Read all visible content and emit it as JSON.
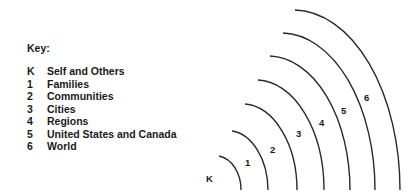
{
  "key": {
    "title": "Key:",
    "items": [
      {
        "code": "K",
        "label": "Self and Others"
      },
      {
        "code": "1",
        "label": "Families"
      },
      {
        "code": "2",
        "label": "Communities"
      },
      {
        "code": "3",
        "label": "Cities"
      },
      {
        "code": "4",
        "label": "Regions"
      },
      {
        "code": "5",
        "label": "United States and Canada"
      },
      {
        "code": "6",
        "label": "World"
      }
    ]
  },
  "diagram": {
    "type": "concentric-quarter-arcs",
    "stroke_color": "#2a2a2a",
    "rings": [
      {
        "label": "K"
      },
      {
        "label": "1"
      },
      {
        "label": "2"
      },
      {
        "label": "3"
      },
      {
        "label": "4"
      },
      {
        "label": "5"
      },
      {
        "label": "6"
      }
    ]
  }
}
